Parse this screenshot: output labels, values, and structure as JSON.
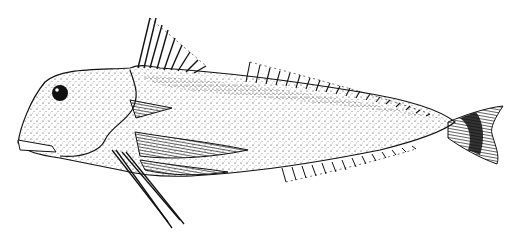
{
  "illustration": {
    "subject": "fish line drawing (gurnard-like), lateral view, stippled",
    "background_color": "#ffffff",
    "ink_color": "#111111"
  }
}
